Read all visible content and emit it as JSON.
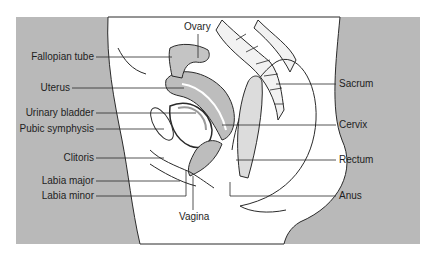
{
  "figure": {
    "type": "anatomical-diagram",
    "colors": {
      "background_panel": "#b9b9b9",
      "body": "#ffffff",
      "organ_fill": "#bdbdbd",
      "outline": "#2a2a2a"
    }
  },
  "labels": {
    "left": [
      {
        "text": "Fallopian tube"
      },
      {
        "text": "Uterus"
      },
      {
        "text": "Urinary bladder"
      },
      {
        "text": "Pubic symphysis"
      },
      {
        "text": "Clitoris"
      },
      {
        "text": "Labia major"
      },
      {
        "text": "Labia minor"
      }
    ],
    "right": [
      {
        "text": "Sacrum"
      },
      {
        "text": "Cervix"
      },
      {
        "text": "Rectum"
      },
      {
        "text": "Anus"
      }
    ],
    "top": [
      {
        "text": "Ovary"
      }
    ],
    "bottom": [
      {
        "text": "Vagina"
      }
    ]
  }
}
